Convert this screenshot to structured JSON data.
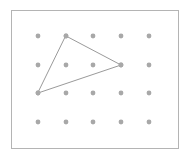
{
  "figure": {
    "name": "geoboard-dot-grid-triangle",
    "canvas": {
      "width": 190,
      "height": 161,
      "background": "#ffffff"
    },
    "frame": {
      "label": "figure-border",
      "x": 11,
      "y": 10,
      "width": 167,
      "height": 138,
      "stroke": "#b4b4b4",
      "stroke_width": 1,
      "fill": "#ffffff"
    },
    "grid": {
      "label": "dot-grid",
      "columns": 5,
      "rows": 4,
      "column_x": [
        38,
        66,
        93,
        121,
        149
      ],
      "row_y": [
        36,
        65,
        93,
        122
      ],
      "dot_radius": 2.4,
      "dot_color": "#a8a8a8",
      "column_spacing": 27.75,
      "row_spacing": 28.67,
      "points": [
        {
          "id": "r0c0",
          "col": 0,
          "row": 0,
          "x": 38,
          "y": 36
        },
        {
          "id": "r0c1",
          "col": 1,
          "row": 0,
          "x": 66,
          "y": 36
        },
        {
          "id": "r0c2",
          "col": 2,
          "row": 0,
          "x": 93,
          "y": 36
        },
        {
          "id": "r0c3",
          "col": 3,
          "row": 0,
          "x": 121,
          "y": 36
        },
        {
          "id": "r0c4",
          "col": 4,
          "row": 0,
          "x": 149,
          "y": 36
        },
        {
          "id": "r1c0",
          "col": 0,
          "row": 1,
          "x": 38,
          "y": 65
        },
        {
          "id": "r1c1",
          "col": 1,
          "row": 1,
          "x": 66,
          "y": 65
        },
        {
          "id": "r1c2",
          "col": 2,
          "row": 1,
          "x": 93,
          "y": 65
        },
        {
          "id": "r1c3",
          "col": 3,
          "row": 1,
          "x": 121,
          "y": 65
        },
        {
          "id": "r1c4",
          "col": 4,
          "row": 1,
          "x": 149,
          "y": 65
        },
        {
          "id": "r2c0",
          "col": 0,
          "row": 2,
          "x": 38,
          "y": 93
        },
        {
          "id": "r2c1",
          "col": 1,
          "row": 2,
          "x": 66,
          "y": 93
        },
        {
          "id": "r2c2",
          "col": 2,
          "row": 2,
          "x": 93,
          "y": 93
        },
        {
          "id": "r2c3",
          "col": 3,
          "row": 2,
          "x": 121,
          "y": 93
        },
        {
          "id": "r2c4",
          "col": 4,
          "row": 2,
          "x": 149,
          "y": 93
        },
        {
          "id": "r3c0",
          "col": 0,
          "row": 3,
          "x": 38,
          "y": 122
        },
        {
          "id": "r3c1",
          "col": 1,
          "row": 3,
          "x": 66,
          "y": 122
        },
        {
          "id": "r3c2",
          "col": 2,
          "row": 3,
          "x": 93,
          "y": 122
        },
        {
          "id": "r3c3",
          "col": 3,
          "row": 3,
          "x": 121,
          "y": 122
        },
        {
          "id": "r3c4",
          "col": 4,
          "row": 3,
          "x": 149,
          "y": 122
        }
      ]
    },
    "shape": {
      "label": "triangle",
      "type": "polygon",
      "stroke": "#9a9a9a",
      "stroke_width": 1,
      "fill": "none",
      "vertex_ids": [
        "r0c1",
        "r1c3",
        "r2c0"
      ],
      "vertices": [
        {
          "name": "top-vertex",
          "grid_id": "r0c1",
          "x": 66,
          "y": 36
        },
        {
          "name": "right-vertex",
          "grid_id": "r1c3",
          "x": 121,
          "y": 65
        },
        {
          "name": "left-vertex",
          "grid_id": "r2c0",
          "x": 38,
          "y": 93
        }
      ],
      "points_attr": "66,36 121,65 38,93",
      "edges": [
        {
          "name": "edge-top-right",
          "from": "r0c1",
          "to": "r1c3"
        },
        {
          "name": "edge-right-left",
          "from": "r1c3",
          "to": "r2c0"
        },
        {
          "name": "edge-left-top",
          "from": "r2c0",
          "to": "r0c1"
        }
      ]
    }
  }
}
